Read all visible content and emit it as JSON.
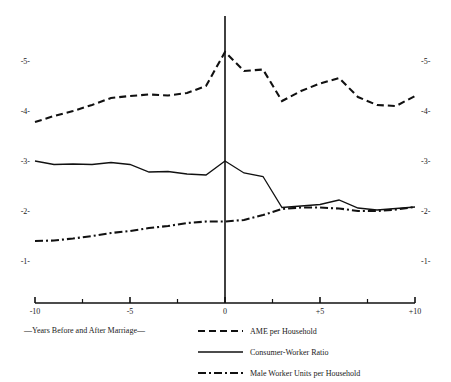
{
  "chart_data": {
    "type": "line",
    "title": "",
    "xlabel": "—Years Before and After Marriage—",
    "ylabel": "",
    "xlim": [
      -10,
      10
    ],
    "ylim": [
      0.45,
      5.7
    ],
    "grid": false,
    "legend_position": "bottom-right",
    "x_ticks": [
      -10,
      -5,
      0,
      5,
      10
    ],
    "x_tick_labels": [
      "-10",
      "-5",
      "0",
      "+5",
      "+10"
    ],
    "x_minor_ticks": [
      -7.5,
      -2.5,
      2.5,
      7.5
    ],
    "y_ticks": [
      1,
      2,
      3,
      4,
      5
    ],
    "y_tick_labels_left": [
      "-1-",
      "-2-",
      "-3-",
      "-4-",
      "-5-"
    ],
    "y_tick_labels_right": [
      "-1-",
      "-2-",
      "-3-",
      "-4-",
      "-5-"
    ],
    "x": [
      -10,
      -9,
      -8,
      -7,
      -6,
      -5,
      -4,
      -3,
      -2,
      -1,
      0,
      1,
      2,
      3,
      4,
      5,
      6,
      7,
      8,
      9,
      10
    ],
    "series": [
      {
        "name": "AME per Household",
        "style": "dashed",
        "values": [
          3.78,
          3.9,
          4.0,
          4.12,
          4.26,
          4.3,
          4.33,
          4.31,
          4.36,
          4.5,
          5.18,
          4.8,
          4.83,
          4.2,
          4.4,
          4.55,
          4.66,
          4.28,
          4.12,
          4.1,
          4.3
        ]
      },
      {
        "name": "Consumer-Worker Ratio",
        "style": "solid",
        "values": [
          3.0,
          2.93,
          2.94,
          2.93,
          2.97,
          2.93,
          2.78,
          2.79,
          2.74,
          2.72,
          3.0,
          2.76,
          2.69,
          2.07,
          2.1,
          2.13,
          2.22,
          2.06,
          2.02,
          2.05,
          2.08
        ]
      },
      {
        "name": "Male Worker Units per Household",
        "style": "dashdot",
        "values": [
          1.4,
          1.41,
          1.45,
          1.5,
          1.56,
          1.6,
          1.66,
          1.7,
          1.76,
          1.79,
          1.79,
          1.82,
          1.92,
          2.04,
          2.07,
          2.07,
          2.05,
          2.0,
          2.0,
          2.03,
          2.08
        ]
      }
    ],
    "legend": [
      {
        "label": "AME per Household",
        "style": "dashed"
      },
      {
        "label": "Consumer-Worker Ratio",
        "style": "solid"
      },
      {
        "label": "Male Worker Units per Household",
        "style": "dashdot"
      }
    ]
  }
}
